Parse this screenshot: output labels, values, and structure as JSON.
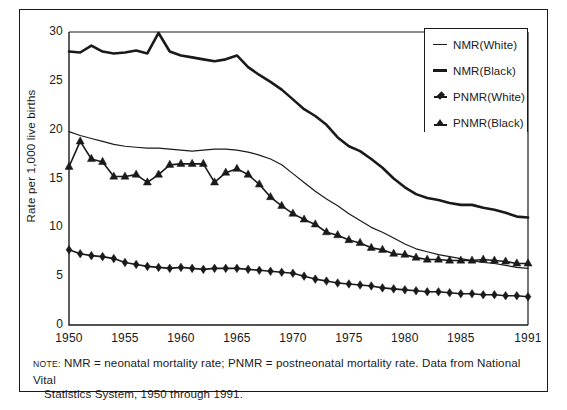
{
  "figure": {
    "note_label": "NOTE:",
    "note_text": "NMR = neonatal mortality rate; PNMR = postneonatal mortality rate.  Data from National Vital Statistics System, 1950 through 1991.",
    "note_line1": "NMR = neonatal mortality rate; PNMR = postneonatal mortality rate.  Data from National Vital",
    "note_line2": "Statistics System, 1950 through 1991."
  },
  "colors": {
    "ink": "#1a1a1a",
    "background": "#ffffff"
  },
  "chart_data": {
    "type": "line",
    "title": "",
    "subtitle": "",
    "xlabel": "",
    "ylabel": "Rate  per 1,000 live births",
    "xlim": [
      1950,
      1991
    ],
    "ylim": [
      0,
      30
    ],
    "grid": false,
    "legend_position": "top-right",
    "y_ticks": [
      0,
      5,
      10,
      15,
      20,
      25,
      30
    ],
    "y_tick_labels": [
      "0",
      "5",
      "10",
      "15",
      "20",
      "25",
      "30"
    ],
    "x_ticks": [
      1950,
      1955,
      1960,
      1965,
      1970,
      1975,
      1980,
      1985,
      1991
    ],
    "x_tick_labels": [
      "1950",
      "1955",
      "1960",
      "1965",
      "1970",
      "1975",
      "1980",
      "1985",
      "1991"
    ],
    "x": [
      1950,
      1951,
      1952,
      1953,
      1954,
      1955,
      1956,
      1957,
      1958,
      1959,
      1960,
      1961,
      1962,
      1963,
      1964,
      1965,
      1966,
      1967,
      1968,
      1969,
      1970,
      1971,
      1972,
      1973,
      1974,
      1975,
      1976,
      1977,
      1978,
      1979,
      1980,
      1981,
      1982,
      1983,
      1984,
      1985,
      1986,
      1987,
      1988,
      1989,
      1990,
      1991
    ],
    "series": [
      {
        "name": "NMR(White)",
        "marker": "none",
        "line_width": 1.2,
        "values": [
          19.8,
          19.4,
          19.1,
          18.8,
          18.5,
          18.3,
          18.2,
          18.1,
          18.1,
          18.0,
          17.9,
          17.8,
          17.9,
          18.0,
          18.0,
          17.9,
          17.7,
          17.4,
          17.0,
          16.4,
          15.5,
          14.6,
          13.7,
          12.9,
          12.2,
          11.4,
          10.7,
          10.0,
          9.5,
          8.9,
          8.3,
          7.8,
          7.5,
          7.2,
          7.0,
          6.8,
          6.6,
          6.4,
          6.3,
          6.1,
          5.9,
          5.8
        ]
      },
      {
        "name": "NMR(Black)",
        "marker": "none",
        "line_width": 2.6,
        "values": [
          28.0,
          27.9,
          28.6,
          28.0,
          27.8,
          27.9,
          28.1,
          27.8,
          29.9,
          28.0,
          27.6,
          27.4,
          27.2,
          27.0,
          27.2,
          27.6,
          26.4,
          25.6,
          24.9,
          24.1,
          23.1,
          22.1,
          21.4,
          20.5,
          19.2,
          18.3,
          17.8,
          17.0,
          16.1,
          15.0,
          14.1,
          13.4,
          13.0,
          12.8,
          12.5,
          12.3,
          12.3,
          12.0,
          11.8,
          11.5,
          11.1,
          11.0
        ]
      },
      {
        "name": "PNMR(White)",
        "marker": "diamond",
        "line_width": 1.6,
        "values": [
          7.7,
          7.3,
          7.1,
          7.0,
          6.8,
          6.4,
          6.2,
          6.0,
          5.9,
          5.8,
          5.9,
          5.8,
          5.7,
          5.8,
          5.8,
          5.8,
          5.7,
          5.6,
          5.5,
          5.4,
          5.3,
          5.0,
          4.7,
          4.5,
          4.3,
          4.2,
          4.1,
          4.0,
          3.8,
          3.7,
          3.6,
          3.5,
          3.4,
          3.4,
          3.3,
          3.2,
          3.2,
          3.1,
          3.1,
          3.0,
          3.0,
          2.9
        ]
      },
      {
        "name": "PNMR(Black)",
        "marker": "triangle",
        "line_width": 1.6,
        "values": [
          16.2,
          18.8,
          17.0,
          16.7,
          15.2,
          15.2,
          15.4,
          14.6,
          15.4,
          16.4,
          16.5,
          16.5,
          16.5,
          14.6,
          15.6,
          16.0,
          15.4,
          14.4,
          13.1,
          12.2,
          11.4,
          10.8,
          10.3,
          9.5,
          9.2,
          8.7,
          8.4,
          7.9,
          7.7,
          7.3,
          7.2,
          6.9,
          6.7,
          6.7,
          6.6,
          6.6,
          6.6,
          6.7,
          6.6,
          6.5,
          6.3,
          6.3
        ]
      }
    ],
    "legend_entries": [
      {
        "label": "NMR(White)",
        "key": "line-thin"
      },
      {
        "label": "NMR(Black)",
        "key": "line-thick"
      },
      {
        "label": "PNMR(White)",
        "key": "diamond"
      },
      {
        "label": "PNMR(Black)",
        "key": "triangle"
      }
    ]
  }
}
